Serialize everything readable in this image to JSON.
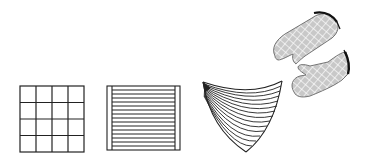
{
  "figure": {
    "stroke_color": "#1a1a1a",
    "fill_color": "#cfcfcf",
    "background": "#ffffff"
  },
  "items": [
    {
      "name": "grid-quilted-potholder",
      "pattern": "4x4 square grid",
      "rows": 4,
      "cols": 4
    },
    {
      "name": "striped-potholder",
      "pattern": "horizontal stripes with side bindings",
      "stripe_count": 15
    },
    {
      "name": "fan-potholder",
      "pattern": "fanned curved lines radiating from corner",
      "line_count": 14
    },
    {
      "name": "oven-mitt-upper",
      "pattern": "diamond lattice quilting",
      "cuff": "dark binding"
    },
    {
      "name": "oven-mitt-lower",
      "pattern": "diamond lattice quilting",
      "cuff": "dark binding"
    }
  ]
}
